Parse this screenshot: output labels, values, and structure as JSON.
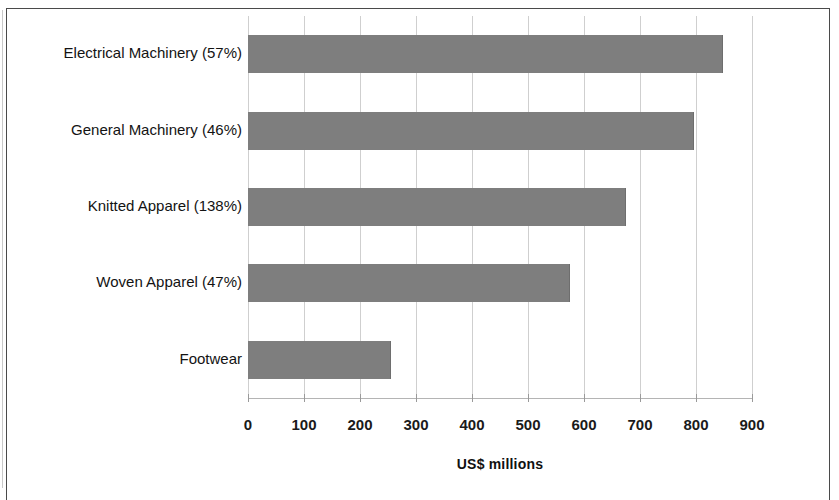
{
  "chart_data": {
    "type": "bar",
    "orientation": "horizontal",
    "title": "",
    "xlabel": "US$ millions",
    "ylabel": "",
    "xlim": [
      0,
      900
    ],
    "xticks": [
      "0",
      "100",
      "200",
      "300",
      "400",
      "500",
      "600",
      "700",
      "800",
      "900"
    ],
    "xtick_values": [
      0,
      100,
      200,
      300,
      400,
      500,
      600,
      700,
      800,
      900
    ],
    "grid": true,
    "legend": false,
    "bar_color": "#7e7e7e",
    "categories": [
      "Electrical Machinery (57%)",
      "General Machinery (46%)",
      "Knitted Apparel (138%)",
      "Woven Apparel (47%)",
      "Footwear"
    ],
    "values": [
      846,
      795,
      673,
      574,
      253
    ]
  }
}
